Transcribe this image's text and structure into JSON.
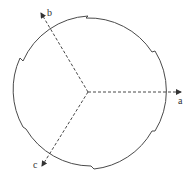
{
  "diagram": {
    "type": "notched-circle-with-axes",
    "colors": {
      "stroke": "#4a4a4a",
      "axis": "#333333",
      "background": "#ffffff"
    },
    "center": [
      88,
      92
    ],
    "axes": [
      {
        "id": "a",
        "label": "a",
        "tip": [
          182,
          92
        ],
        "label_pos": [
          178,
          104
        ]
      },
      {
        "id": "b",
        "label": "b",
        "tip": [
          40,
          12
        ],
        "label_pos": [
          47,
          16
        ]
      },
      {
        "id": "c",
        "label": "c",
        "tip": [
          42,
          167
        ],
        "label_pos": [
          33,
          168
        ]
      }
    ]
  }
}
